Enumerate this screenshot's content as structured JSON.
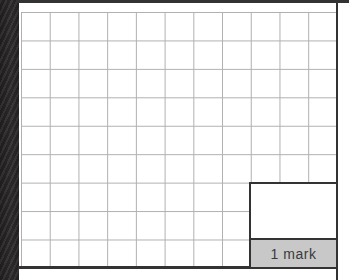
{
  "mark_box": {
    "label": "1 mark"
  },
  "grid": {
    "columns": 11,
    "rows": 9
  },
  "colors": {
    "page_bg": "#ffffff",
    "binding_bar": "#2d2b2c",
    "grid_line": "#b0b0b0",
    "border_dark": "#333333",
    "mark_strip_bg": "#c8c8c8",
    "mark_text": "#3a3a3a"
  }
}
